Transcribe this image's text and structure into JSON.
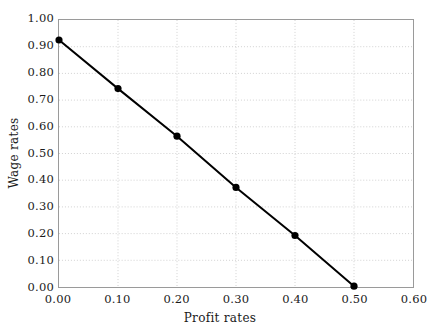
{
  "chart_data": {
    "type": "line",
    "title": "",
    "subtitle": "",
    "xlabel": "Profit rates",
    "ylabel": "Wage rates",
    "xlim": [
      0.0,
      0.6
    ],
    "ylim": [
      0.0,
      1.0
    ],
    "grid": true,
    "legend": false,
    "legend_position": "none",
    "xticks": [
      "0.00",
      "0.10",
      "0.20",
      "0.30",
      "0.40",
      "0.50",
      "0.60"
    ],
    "xtick_values": [
      0.0,
      0.1,
      0.2,
      0.3,
      0.4,
      0.5,
      0.6
    ],
    "yticks": [
      "0.00",
      "0.10",
      "0.20",
      "0.30",
      "0.40",
      "0.50",
      "0.60",
      "0.70",
      "0.80",
      "0.90",
      "1.00"
    ],
    "ytick_values": [
      0.0,
      0.1,
      0.2,
      0.3,
      0.4,
      0.5,
      0.6,
      0.7,
      0.8,
      0.9,
      1.0
    ],
    "x": [
      0.0,
      0.1,
      0.2,
      0.3,
      0.4,
      0.5
    ],
    "series": [
      {
        "name": "wage-profit frontier",
        "values": [
          0.925,
          0.743,
          0.565,
          0.373,
          0.193,
          0.003
        ],
        "color": "#000000",
        "marker": "circle",
        "line_width": 2
      }
    ]
  },
  "style": {
    "background": "#ffffff",
    "axis_color": "#9a9a9a",
    "grid_color": "#cccccc",
    "text_color": "#1a1a1a",
    "line_color": "#000000",
    "marker_color": "#000000"
  }
}
